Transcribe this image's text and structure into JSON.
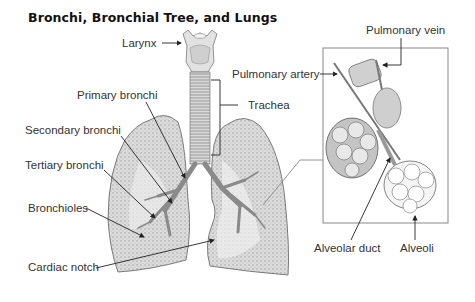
{
  "title": "Bronchi, Bronchial Tree, and Lungs",
  "labels": {
    "larynx": "Larynx",
    "primary_bronchi": "Primary bronchi",
    "secondary_bronchi": "Secondary bronchi",
    "tertiary_bronchi": "Tertiary bronchi",
    "bronchioles": "Bronchioles",
    "cardiac_notch": "Cardiac notch",
    "trachea": "Trachea",
    "pulmonary_artery": "Pulmonary artery",
    "pulmonary_vein": "Pulmonary vein",
    "alveolar_duct": "Alveolar duct",
    "alveoli": "Alveoli"
  },
  "colors": {
    "line": "#222222",
    "tissue": "#c8c8c8",
    "tissue_dark": "#8a8a8a",
    "background": "#ffffff"
  }
}
